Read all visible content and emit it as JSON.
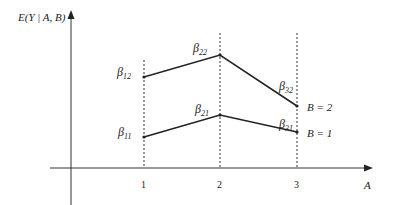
{
  "diagram": {
    "y_axis_label": "E(Y | A, B)",
    "x_axis_label": "A",
    "x_ticks": [
      "1",
      "2",
      "3"
    ],
    "series": [
      {
        "name": "B = 2",
        "points": [
          {
            "a": 1,
            "label_sym": "β",
            "label_sub": "12"
          },
          {
            "a": 2,
            "label_sym": "β",
            "label_sub": "22"
          },
          {
            "a": 3,
            "label_sym": "β",
            "label_sub": "32"
          }
        ]
      },
      {
        "name": "B = 1",
        "points": [
          {
            "a": 1,
            "label_sym": "β",
            "label_sub": "11"
          },
          {
            "a": 2,
            "label_sym": "β",
            "label_sub": "21"
          },
          {
            "a": 3,
            "label_sym": "β",
            "label_sub": "31"
          }
        ]
      }
    ]
  }
}
